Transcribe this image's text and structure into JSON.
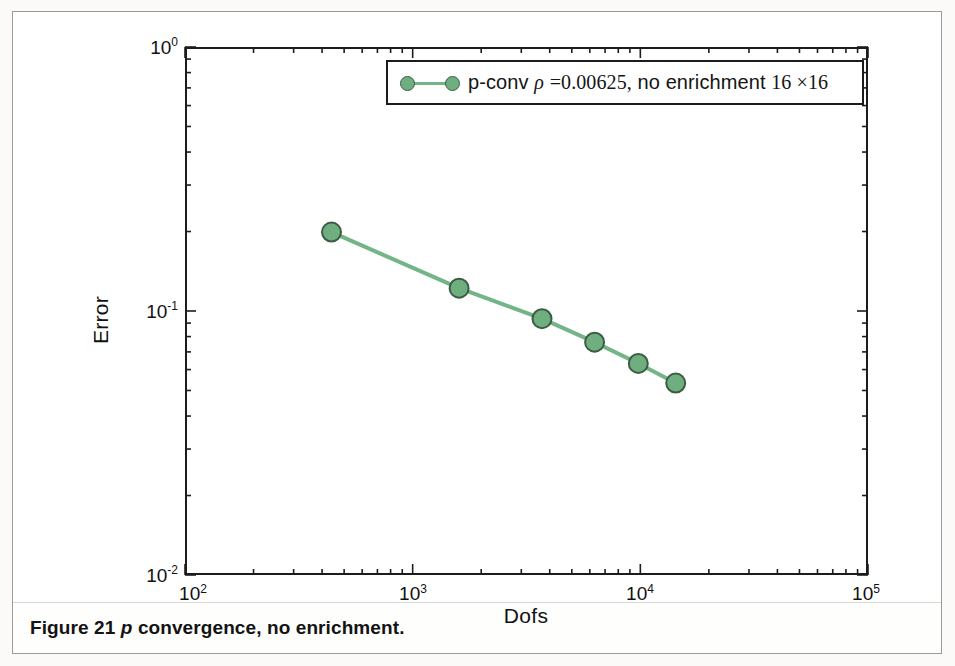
{
  "figure": {
    "caption_prefix": "Figure 21",
    "caption_italic": "p",
    "caption_rest": "convergence, no enrichment."
  },
  "legend": {
    "prefix": "p-conv",
    "rho_symbol": "ρ",
    "equals_value": "=0.00625,",
    "middle": "no enrichment",
    "grid": "16 ×16",
    "full_text": "p-conv ρ =0.00625, no enrichment 16 ×16",
    "marker_color": "#6fae7f",
    "marker_edge_color": "#3c5c44",
    "line_color": "#74b587"
  },
  "axes": {
    "x_title": "Dofs",
    "y_title": "Error",
    "x_ticks": [
      {
        "label_mantissa": "10",
        "label_exp": "2",
        "value": 100
      },
      {
        "label_mantissa": "10",
        "label_exp": "3",
        "value": 1000
      },
      {
        "label_mantissa": "10",
        "label_exp": "4",
        "value": 10000
      },
      {
        "label_mantissa": "10",
        "label_exp": "5",
        "value": 100000
      }
    ],
    "y_ticks": [
      {
        "label_mantissa": "10",
        "label_exp": "0",
        "value": 1
      },
      {
        "label_mantissa": "10",
        "label_exp": "-1",
        "value": 0.1
      },
      {
        "label_mantissa": "10",
        "label_exp": "-2",
        "value": 0.01
      }
    ]
  },
  "chart_data": {
    "type": "line",
    "title": "",
    "xlabel": "Dofs",
    "ylabel": "Error",
    "xscale": "log",
    "yscale": "log",
    "xlim": [
      100,
      100000
    ],
    "ylim": [
      0.01,
      1
    ],
    "grid": false,
    "legend_position": "upper right",
    "series": [
      {
        "name": "p-conv ρ =0.00625, no enrichment 16 ×16",
        "color": "#6fae7f",
        "marker": "circle",
        "x": [
          440,
          1600,
          3700,
          6300,
          9800,
          14300
        ],
        "y": [
          0.199,
          0.122,
          0.0935,
          0.0762,
          0.0633,
          0.0533
        ]
      }
    ]
  }
}
